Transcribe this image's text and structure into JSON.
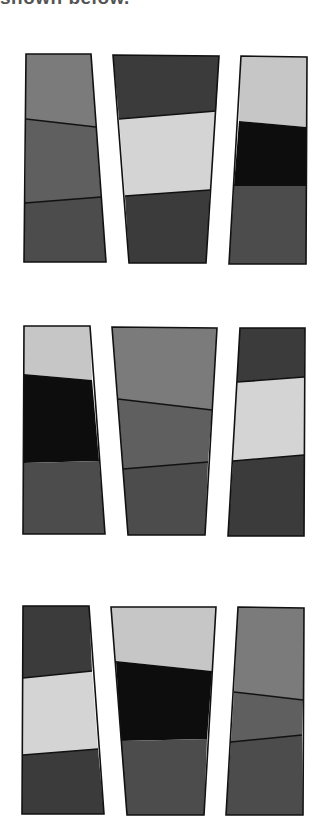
{
  "caption": "shown below.",
  "colors": {
    "light": "#d4d4d4",
    "light_alt": "#c6c6c6",
    "mid": "#7b7b7b",
    "mid_dark": "#5f5f5f",
    "dark": "#4c4c4c",
    "darker": "#3b3b3b",
    "black": "#0d0d0d",
    "stroke": "#111111"
  },
  "shapes": [
    {
      "name": "row1-col1",
      "outline": [
        [
          26,
          54
        ],
        [
          91,
          54
        ],
        [
          106,
          262
        ],
        [
          24,
          262
        ]
      ],
      "bands": [
        {
          "color": "mid",
          "pts": [
            [
              26,
              54
            ],
            [
              91,
              54
            ],
            [
              96,
              127
            ],
            [
              26,
              119
            ]
          ]
        },
        {
          "color": "mid_dark",
          "pts": [
            [
              26,
              119
            ],
            [
              96,
              127
            ],
            [
              101,
              197
            ],
            [
              25,
              203
            ]
          ]
        },
        {
          "color": "dark",
          "pts": [
            [
              25,
              203
            ],
            [
              101,
              197
            ],
            [
              106,
              262
            ],
            [
              24,
              262
            ]
          ]
        }
      ],
      "dividers": [
        [
          [
            26,
            119
          ],
          [
            96,
            127
          ]
        ],
        [
          [
            25,
            203
          ],
          [
            101,
            197
          ]
        ]
      ]
    },
    {
      "name": "row1-col2",
      "outline": [
        [
          113,
          55
        ],
        [
          219,
          56
        ],
        [
          206,
          263
        ],
        [
          129,
          263
        ]
      ],
      "bands": [
        {
          "color": "darker",
          "pts": [
            [
              113,
              55
            ],
            [
              219,
              56
            ],
            [
              216,
              111
            ],
            [
              119,
              119
            ]
          ]
        },
        {
          "color": "light",
          "pts": [
            [
              119,
              119
            ],
            [
              216,
              111
            ],
            [
              210,
              190
            ],
            [
              125,
              196
            ]
          ]
        },
        {
          "color": "darker",
          "pts": [
            [
              125,
              196
            ],
            [
              210,
              190
            ],
            [
              206,
              263
            ],
            [
              129,
              263
            ]
          ]
        }
      ],
      "dividers": [
        [
          [
            119,
            119
          ],
          [
            216,
            111
          ]
        ],
        [
          [
            125,
            196
          ],
          [
            210,
            190
          ]
        ]
      ]
    },
    {
      "name": "row1-col3",
      "outline": [
        [
          241,
          56
        ],
        [
          307,
          57
        ],
        [
          306,
          264
        ],
        [
          229,
          264
        ]
      ],
      "bands": [
        {
          "color": "light_alt",
          "pts": [
            [
              241,
              56
            ],
            [
              307,
              57
            ],
            [
              306,
              127
            ],
            [
              239,
              121
            ]
          ]
        },
        {
          "color": "black",
          "pts": [
            [
              239,
              121
            ],
            [
              306,
              127
            ],
            [
              306,
              186
            ],
            [
              234,
              186
            ]
          ]
        },
        {
          "color": "dark",
          "pts": [
            [
              234,
              186
            ],
            [
              306,
              186
            ],
            [
              306,
              264
            ],
            [
              229,
              264
            ]
          ]
        }
      ],
      "dividers": []
    },
    {
      "name": "row2-col1",
      "outline": [
        [
          24,
          326
        ],
        [
          90,
          326
        ],
        [
          105,
          534
        ],
        [
          23,
          534
        ]
      ],
      "bands": [
        {
          "color": "light_alt",
          "pts": [
            [
              24,
              326
            ],
            [
              90,
              326
            ],
            [
              92,
              380
            ],
            [
              24,
              374
            ]
          ]
        },
        {
          "color": "black",
          "pts": [
            [
              24,
              374
            ],
            [
              92,
              380
            ],
            [
              99,
              461
            ],
            [
              24,
              463
            ]
          ]
        },
        {
          "color": "dark",
          "pts": [
            [
              24,
              463
            ],
            [
              99,
              461
            ],
            [
              105,
              534
            ],
            [
              23,
              534
            ]
          ]
        }
      ],
      "dividers": []
    },
    {
      "name": "row2-col2",
      "outline": [
        [
          112,
          327
        ],
        [
          217,
          328
        ],
        [
          205,
          535
        ],
        [
          128,
          535
        ]
      ],
      "bands": [
        {
          "color": "mid",
          "pts": [
            [
              112,
              327
            ],
            [
              217,
              328
            ],
            [
              212,
              410
            ],
            [
              118,
              399
            ]
          ]
        },
        {
          "color": "mid_dark",
          "pts": [
            [
              118,
              399
            ],
            [
              212,
              410
            ],
            [
              208,
              462
            ],
            [
              123,
              469
            ]
          ]
        },
        {
          "color": "dark",
          "pts": [
            [
              123,
              469
            ],
            [
              208,
              462
            ],
            [
              205,
              535
            ],
            [
              128,
              535
            ]
          ]
        }
      ],
      "dividers": [
        [
          [
            118,
            399
          ],
          [
            212,
            410
          ]
        ],
        [
          [
            123,
            469
          ],
          [
            208,
            462
          ]
        ]
      ]
    },
    {
      "name": "row2-col3",
      "outline": [
        [
          240,
          328
        ],
        [
          305,
          328
        ],
        [
          304,
          536
        ],
        [
          228,
          536
        ]
      ],
      "bands": [
        {
          "color": "darker",
          "pts": [
            [
              240,
              328
            ],
            [
              305,
              328
            ],
            [
              304,
              377
            ],
            [
              237,
              382
            ]
          ]
        },
        {
          "color": "light",
          "pts": [
            [
              237,
              382
            ],
            [
              304,
              377
            ],
            [
              304,
              455
            ],
            [
              233,
              461
            ]
          ]
        },
        {
          "color": "darker",
          "pts": [
            [
              233,
              461
            ],
            [
              304,
              455
            ],
            [
              304,
              536
            ],
            [
              228,
              536
            ]
          ]
        }
      ],
      "dividers": [
        [
          [
            237,
            382
          ],
          [
            304,
            377
          ]
        ],
        [
          [
            233,
            461
          ],
          [
            304,
            455
          ]
        ]
      ]
    },
    {
      "name": "row3-col1",
      "outline": [
        [
          23,
          606
        ],
        [
          89,
          606
        ],
        [
          104,
          814
        ],
        [
          22,
          814
        ]
      ],
      "bands": [
        {
          "color": "darker",
          "pts": [
            [
              23,
              606
            ],
            [
              89,
              606
            ],
            [
              92,
              671
            ],
            [
              23,
              678
            ]
          ]
        },
        {
          "color": "light",
          "pts": [
            [
              23,
              678
            ],
            [
              92,
              671
            ],
            [
              98,
              749
            ],
            [
              23,
              755
            ]
          ]
        },
        {
          "color": "darker",
          "pts": [
            [
              23,
              755
            ],
            [
              98,
              749
            ],
            [
              104,
              814
            ],
            [
              22,
              814
            ]
          ]
        }
      ],
      "dividers": [
        [
          [
            23,
            678
          ],
          [
            92,
            671
          ]
        ],
        [
          [
            23,
            755
          ],
          [
            98,
            749
          ]
        ]
      ]
    },
    {
      "name": "row3-col2",
      "outline": [
        [
          111,
          607
        ],
        [
          216,
          607
        ],
        [
          204,
          815
        ],
        [
          127,
          815
        ]
      ],
      "bands": [
        {
          "color": "light_alt",
          "pts": [
            [
              111,
              607
            ],
            [
              216,
              607
            ],
            [
              212,
              671
            ],
            [
              116,
              661
            ]
          ]
        },
        {
          "color": "black",
          "pts": [
            [
              116,
              661
            ],
            [
              212,
              671
            ],
            [
              207,
              739
            ],
            [
              121,
              741
            ]
          ]
        },
        {
          "color": "dark",
          "pts": [
            [
              121,
              741
            ],
            [
              207,
              739
            ],
            [
              204,
              815
            ],
            [
              127,
              815
            ]
          ]
        }
      ],
      "dividers": []
    },
    {
      "name": "row3-col3",
      "outline": [
        [
          238,
          607
        ],
        [
          304,
          608
        ],
        [
          303,
          815
        ],
        [
          226,
          815
        ]
      ],
      "bands": [
        {
          "color": "mid",
          "pts": [
            [
              238,
              607
            ],
            [
              304,
              608
            ],
            [
              303,
              700
            ],
            [
              234,
              692
            ]
          ]
        },
        {
          "color": "mid_dark",
          "pts": [
            [
              234,
              692
            ],
            [
              303,
              700
            ],
            [
              302,
              735
            ],
            [
              231,
              742
            ]
          ]
        },
        {
          "color": "dark",
          "pts": [
            [
              231,
              742
            ],
            [
              302,
              735
            ],
            [
              303,
              815
            ],
            [
              226,
              815
            ]
          ]
        }
      ],
      "dividers": [
        [
          [
            234,
            692
          ],
          [
            303,
            700
          ]
        ],
        [
          [
            231,
            742
          ],
          [
            302,
            735
          ]
        ]
      ]
    }
  ]
}
